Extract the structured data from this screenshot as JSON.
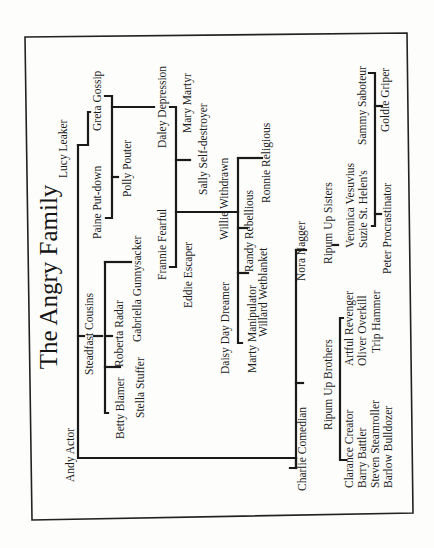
{
  "document": {
    "title": "The Angry Family",
    "orientation": "rotated-90-ccw",
    "colors": {
      "ink": "#1a1a1a",
      "paper": "#fdfdfc"
    }
  },
  "tree": {
    "root": "Andy Actor",
    "spouse_left": "Lucy Leaker",
    "spouse_right": "Charlie Comedian",
    "people": {
      "lucy_leaker": "Lucy Leaker",
      "greta_gossip": "Greta Gossip",
      "paine_put_down": "Paine Put-down",
      "polly_pouter": "Polly Pouter",
      "daley_depression": "Daley Depression",
      "mary_martyr": "Mary Martyr",
      "sally_self_destroyer": "Sally Self-destroyer",
      "frannie_fearful": "Frannie Fearful",
      "eddie_escaper": "Eddie Escaper",
      "willie_withdrawn": "Willie Withdrawn",
      "ronnie_religious": "Ronnie Religious",
      "randy_rebellious": "Randy Rebellious",
      "willard_wetblanket": "Willard Wetblanket",
      "daisy_day_dreamer": "Daisy Day Dreamer",
      "marty_manipulator": "Marty Manipulator",
      "steadfast_cousins": "Steadfast Cousins",
      "roberta_radar": "Roberta Radar",
      "gabriella_gunnysacker": "Gabriella Gunnysacker",
      "betty_blamer": "Betty Blamer",
      "stella_stuffer": "Stella Stuffer",
      "andy_actor": "Andy Actor",
      "charlie_comedian": "Charlie Comedian",
      "nora_nagger": "Nora Nagger",
      "ripum_up_sisters": "Ripum Up Sisters",
      "veronica_vesuvius": "Veronica Vesuvius",
      "suzie_st_helens": "Suzie St. Helen's",
      "peter_procrastinator": "Peter Procrastinator",
      "sammy_saboteur": "Sammy Saboteur",
      "goldie_griper": "Goldie Griper",
      "ripum_up_brothers": "Ripum Up Brothers",
      "artful_revenger": "Artful Revenger",
      "oliver_overkill": "Oliver Overkill",
      "trip_hammer": "Trip Hammer",
      "clarance_creator": "Clarance Creator",
      "barry_battler": "Barry Battler",
      "steven_steamroller": "Steven Steamroller",
      "barlow_bulldozer": "Barlow Bulldozer"
    }
  }
}
